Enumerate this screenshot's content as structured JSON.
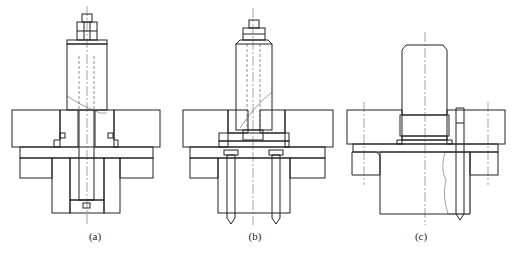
{
  "figure": {
    "line_color": "#222222",
    "background": "#ffffff",
    "panels": [
      {
        "id": "a",
        "label": "(a)",
        "label_x": 95,
        "label_y": 237
      },
      {
        "id": "b",
        "label": "(b)",
        "label_x": 255,
        "label_y": 237
      },
      {
        "id": "c",
        "label": "(c)",
        "label_x": 421,
        "label_y": 237
      }
    ]
  }
}
